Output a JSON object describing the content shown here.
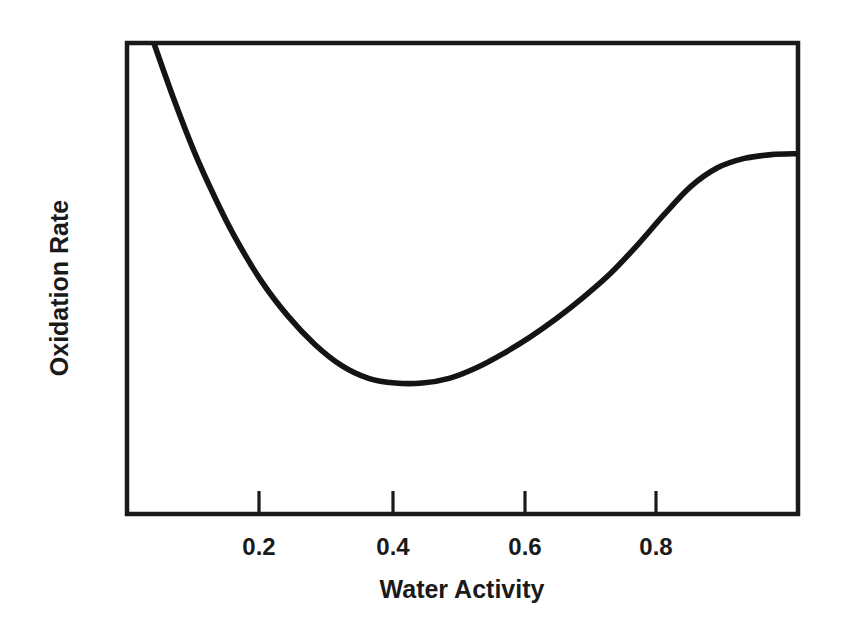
{
  "chart_data": {
    "type": "line",
    "title": "",
    "xlabel": "Water Activity",
    "ylabel": "Oxidation Rate",
    "xlim": [
      0.0,
      1.0
    ],
    "ylim": [
      0,
      100
    ],
    "grid": false,
    "legend": null,
    "x_ticks": [
      0.2,
      0.4,
      0.6,
      0.8
    ],
    "x_tick_labels": [
      "0.2",
      "0.4",
      "0.6",
      "0.8"
    ],
    "y_ticks": [],
    "y_tick_labels": [],
    "line_color": "#141414",
    "background_color": "#ffffff",
    "series": [
      {
        "name": "Oxidation Rate",
        "x": [
          0.04,
          0.07,
          0.1,
          0.13,
          0.16,
          0.2,
          0.24,
          0.28,
          0.32,
          0.36,
          0.4,
          0.44,
          0.48,
          0.52,
          0.56,
          0.6,
          0.64,
          0.68,
          0.72,
          0.76,
          0.8,
          0.84,
          0.88,
          0.92,
          0.96,
          1.0
        ],
        "y": [
          100.0,
          88.0,
          77.0,
          67.5,
          59.0,
          49.5,
          42.0,
          36.0,
          31.5,
          28.8,
          27.8,
          27.8,
          28.8,
          31.0,
          34.0,
          37.5,
          41.5,
          46.0,
          51.0,
          57.0,
          63.5,
          69.5,
          73.5,
          75.5,
          76.3,
          76.5
        ]
      }
    ],
    "annotations": []
  },
  "axes": {
    "x_axis_title": "Water Activity",
    "y_axis_title": "Oxidation Rate",
    "tick_labels": {
      "t1": "0.2",
      "t2": "0.4",
      "t3": "0.6",
      "t4": "0.8"
    }
  }
}
